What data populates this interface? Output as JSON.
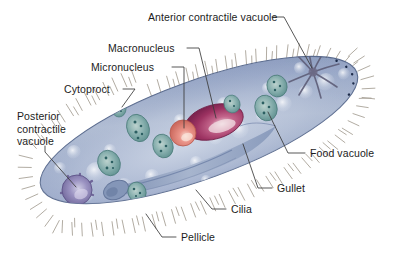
{
  "figure": {
    "organism": "Paramecium",
    "background_color": "#ffffff",
    "body_color": "#8d9cc0",
    "body_color_light": "#b9c4da",
    "outline_color": "#4a5a7d",
    "cilia_color": "#9a9383",
    "pellicle_dot_color": "#1d2b4a"
  },
  "labels": {
    "anterior_contractile_vacuole": "Anterior contractile vacuole",
    "macronucleus": "Macronucleus",
    "micronucleus": "Micronucleus",
    "cytoproct": "Cytoproct",
    "posterior_contractile_vacuole": "Posterior\ncontractile\nvacuole",
    "food_vacuole": "Food vacuole",
    "gullet": "Gullet",
    "cilia": "Cilia",
    "pellicle": "Pellicle"
  },
  "structures": {
    "macronucleus_color": "#a03a64",
    "micronucleus_color": "#e08a7e",
    "food_vacuole_color": "#6fa3a0",
    "contractile_vacuole_color": "#8c87b8",
    "gullet_color": "#8fa0bd"
  }
}
